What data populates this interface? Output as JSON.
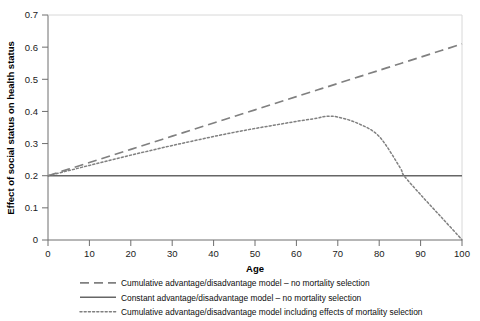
{
  "chart_data": {
    "type": "line",
    "title": "",
    "xlabel": "Age",
    "ylabel": "Effect of social status on health status",
    "xlim": [
      0,
      100
    ],
    "ylim": [
      0,
      0.7
    ],
    "xticks": [
      "0",
      "10",
      "20",
      "30",
      "40",
      "50",
      "60",
      "70",
      "80",
      "90",
      "100"
    ],
    "yticks": [
      "0",
      "0.1",
      "0.2",
      "0.3",
      "0.4",
      "0.5",
      "0.6",
      "0.7"
    ],
    "grid": false,
    "legend_position": "bottom",
    "x": [
      0,
      5,
      10,
      15,
      20,
      25,
      30,
      35,
      40,
      45,
      50,
      55,
      60,
      65,
      67,
      70,
      75,
      80,
      85,
      86,
      90,
      95,
      100
    ],
    "series": [
      {
        "name": "Cumulative advantage/disadvantage model – no mortality selection",
        "style": "dashed",
        "color": "#808080",
        "values": [
          0.2,
          0.2205,
          0.241,
          0.2615,
          0.282,
          0.3025,
          0.323,
          0.3435,
          0.364,
          0.3845,
          0.405,
          0.4255,
          0.446,
          0.4665,
          0.4747,
          0.487,
          0.5075,
          0.528,
          0.5485,
          0.5526,
          0.569,
          0.5895,
          0.61
        ]
      },
      {
        "name": "Constant advantage/disadvantage model – no mortality selection",
        "style": "solid",
        "color": "#666666",
        "values": [
          0.2,
          0.2,
          0.2,
          0.2,
          0.2,
          0.2,
          0.2,
          0.2,
          0.2,
          0.2,
          0.2,
          0.2,
          0.2,
          0.2,
          0.2,
          0.2,
          0.2,
          0.2,
          0.2,
          0.2,
          0.2,
          0.2,
          0.2
        ]
      },
      {
        "name": "Cumulative advantage/disadvantage model including effects of mortality selection",
        "style": "dotted",
        "color": "#808080",
        "values": [
          0.2,
          0.216,
          0.232,
          0.248,
          0.264,
          0.279,
          0.294,
          0.308,
          0.322,
          0.335,
          0.347,
          0.358,
          0.369,
          0.379,
          0.3845,
          0.3825,
          0.362,
          0.322,
          0.226,
          0.2,
          0.141,
          0.071,
          0.001
        ]
      }
    ]
  },
  "legend": {
    "items": [
      {
        "label": "Cumulative advantage/disadvantage model – no mortality selection",
        "style": "dashed"
      },
      {
        "label": "Constant advantage/disadvantage model – no mortality selection",
        "style": "solid"
      },
      {
        "label": "Cumulative advantage/disadvantage model including effects of mortality selection",
        "style": "dotted"
      }
    ]
  },
  "colors": {
    "axis": "#6e6e6e",
    "dashed_line": "#808080",
    "solid_line": "#666666",
    "dotted_line": "#808080",
    "text": "#1a1a1a",
    "background": "#ffffff"
  }
}
